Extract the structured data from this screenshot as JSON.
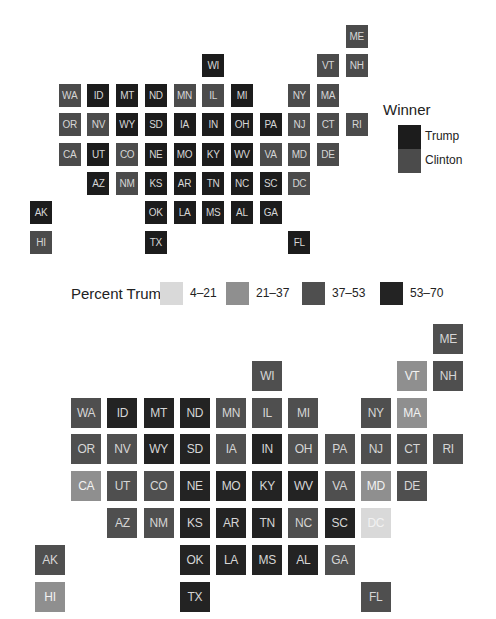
{
  "chart_data": [
    {
      "type": "heatmap",
      "subtype": "tile-grid-map",
      "title": "",
      "legend": {
        "title": "Winner",
        "position": "right",
        "entries": [
          {
            "label": "Trump",
            "color": "#1c1c1c"
          },
          {
            "label": "Clinton",
            "color": "#4b4b4b"
          }
        ]
      },
      "grid": false,
      "tiles": [
        {
          "state": "ME",
          "row": 0,
          "col": 11,
          "value": "Clinton"
        },
        {
          "state": "WI",
          "row": 1,
          "col": 6,
          "value": "Trump"
        },
        {
          "state": "VT",
          "row": 1,
          "col": 10,
          "value": "Clinton"
        },
        {
          "state": "NH",
          "row": 1,
          "col": 11,
          "value": "Clinton"
        },
        {
          "state": "WA",
          "row": 2,
          "col": 1,
          "value": "Clinton"
        },
        {
          "state": "ID",
          "row": 2,
          "col": 2,
          "value": "Trump"
        },
        {
          "state": "MT",
          "row": 2,
          "col": 3,
          "value": "Trump"
        },
        {
          "state": "ND",
          "row": 2,
          "col": 4,
          "value": "Trump"
        },
        {
          "state": "MN",
          "row": 2,
          "col": 5,
          "value": "Clinton"
        },
        {
          "state": "IL",
          "row": 2,
          "col": 6,
          "value": "Clinton"
        },
        {
          "state": "MI",
          "row": 2,
          "col": 7,
          "value": "Trump"
        },
        {
          "state": "NY",
          "row": 2,
          "col": 9,
          "value": "Clinton"
        },
        {
          "state": "MA",
          "row": 2,
          "col": 10,
          "value": "Clinton"
        },
        {
          "state": "OR",
          "row": 3,
          "col": 1,
          "value": "Clinton"
        },
        {
          "state": "NV",
          "row": 3,
          "col": 2,
          "value": "Clinton"
        },
        {
          "state": "WY",
          "row": 3,
          "col": 3,
          "value": "Trump"
        },
        {
          "state": "SD",
          "row": 3,
          "col": 4,
          "value": "Trump"
        },
        {
          "state": "IA",
          "row": 3,
          "col": 5,
          "value": "Trump"
        },
        {
          "state": "IN",
          "row": 3,
          "col": 6,
          "value": "Trump"
        },
        {
          "state": "OH",
          "row": 3,
          "col": 7,
          "value": "Trump"
        },
        {
          "state": "PA",
          "row": 3,
          "col": 8,
          "value": "Trump"
        },
        {
          "state": "NJ",
          "row": 3,
          "col": 9,
          "value": "Clinton"
        },
        {
          "state": "CT",
          "row": 3,
          "col": 10,
          "value": "Clinton"
        },
        {
          "state": "RI",
          "row": 3,
          "col": 11,
          "value": "Clinton"
        },
        {
          "state": "CA",
          "row": 4,
          "col": 1,
          "value": "Clinton"
        },
        {
          "state": "UT",
          "row": 4,
          "col": 2,
          "value": "Trump"
        },
        {
          "state": "CO",
          "row": 4,
          "col": 3,
          "value": "Clinton"
        },
        {
          "state": "NE",
          "row": 4,
          "col": 4,
          "value": "Trump"
        },
        {
          "state": "MO",
          "row": 4,
          "col": 5,
          "value": "Trump"
        },
        {
          "state": "KY",
          "row": 4,
          "col": 6,
          "value": "Trump"
        },
        {
          "state": "WV",
          "row": 4,
          "col": 7,
          "value": "Trump"
        },
        {
          "state": "VA",
          "row": 4,
          "col": 8,
          "value": "Clinton"
        },
        {
          "state": "MD",
          "row": 4,
          "col": 9,
          "value": "Clinton"
        },
        {
          "state": "DE",
          "row": 4,
          "col": 10,
          "value": "Clinton"
        },
        {
          "state": "AZ",
          "row": 5,
          "col": 2,
          "value": "Trump"
        },
        {
          "state": "NM",
          "row": 5,
          "col": 3,
          "value": "Clinton"
        },
        {
          "state": "KS",
          "row": 5,
          "col": 4,
          "value": "Trump"
        },
        {
          "state": "AR",
          "row": 5,
          "col": 5,
          "value": "Trump"
        },
        {
          "state": "TN",
          "row": 5,
          "col": 6,
          "value": "Trump"
        },
        {
          "state": "NC",
          "row": 5,
          "col": 7,
          "value": "Trump"
        },
        {
          "state": "SC",
          "row": 5,
          "col": 8,
          "value": "Trump"
        },
        {
          "state": "DC",
          "row": 5,
          "col": 9,
          "value": "Clinton"
        },
        {
          "state": "AK",
          "row": 6,
          "col": 0,
          "value": "Trump"
        },
        {
          "state": "OK",
          "row": 6,
          "col": 4,
          "value": "Trump"
        },
        {
          "state": "LA",
          "row": 6,
          "col": 5,
          "value": "Trump"
        },
        {
          "state": "MS",
          "row": 6,
          "col": 6,
          "value": "Trump"
        },
        {
          "state": "AL",
          "row": 6,
          "col": 7,
          "value": "Trump"
        },
        {
          "state": "GA",
          "row": 6,
          "col": 8,
          "value": "Trump"
        },
        {
          "state": "HI",
          "row": 7,
          "col": 0,
          "value": "Clinton"
        },
        {
          "state": "TX",
          "row": 7,
          "col": 4,
          "value": "Trump"
        },
        {
          "state": "FL",
          "row": 7,
          "col": 9,
          "value": "Trump"
        }
      ]
    },
    {
      "type": "heatmap",
      "subtype": "tile-grid-map",
      "title": "",
      "legend": {
        "title": "Percent Trump",
        "position": "top",
        "entries": [
          {
            "label": "4–21",
            "color": "#d9d9d9"
          },
          {
            "label": "21–37",
            "color": "#8f8f8f"
          },
          {
            "label": "37–53",
            "color": "#4f4f4f"
          },
          {
            "label": "53–70",
            "color": "#232323"
          }
        ]
      },
      "grid": false,
      "tiles": [
        {
          "state": "ME",
          "row": 0,
          "col": 11,
          "value": "37–53"
        },
        {
          "state": "WI",
          "row": 1,
          "col": 6,
          "value": "37–53"
        },
        {
          "state": "VT",
          "row": 1,
          "col": 10,
          "value": "21–37"
        },
        {
          "state": "NH",
          "row": 1,
          "col": 11,
          "value": "37–53"
        },
        {
          "state": "WA",
          "row": 2,
          "col": 1,
          "value": "37–53"
        },
        {
          "state": "ID",
          "row": 2,
          "col": 2,
          "value": "53–70"
        },
        {
          "state": "MT",
          "row": 2,
          "col": 3,
          "value": "53–70"
        },
        {
          "state": "ND",
          "row": 2,
          "col": 4,
          "value": "53–70"
        },
        {
          "state": "MN",
          "row": 2,
          "col": 5,
          "value": "37–53"
        },
        {
          "state": "IL",
          "row": 2,
          "col": 6,
          "value": "37–53"
        },
        {
          "state": "MI",
          "row": 2,
          "col": 7,
          "value": "37–53"
        },
        {
          "state": "NY",
          "row": 2,
          "col": 9,
          "value": "37–53"
        },
        {
          "state": "MA",
          "row": 2,
          "col": 10,
          "value": "21–37"
        },
        {
          "state": "OR",
          "row": 3,
          "col": 1,
          "value": "37–53"
        },
        {
          "state": "NV",
          "row": 3,
          "col": 2,
          "value": "37–53"
        },
        {
          "state": "WY",
          "row": 3,
          "col": 3,
          "value": "53–70"
        },
        {
          "state": "SD",
          "row": 3,
          "col": 4,
          "value": "53–70"
        },
        {
          "state": "IA",
          "row": 3,
          "col": 5,
          "value": "37–53"
        },
        {
          "state": "IN",
          "row": 3,
          "col": 6,
          "value": "53–70"
        },
        {
          "state": "OH",
          "row": 3,
          "col": 7,
          "value": "37–53"
        },
        {
          "state": "PA",
          "row": 3,
          "col": 8,
          "value": "37–53"
        },
        {
          "state": "NJ",
          "row": 3,
          "col": 9,
          "value": "37–53"
        },
        {
          "state": "CT",
          "row": 3,
          "col": 10,
          "value": "37–53"
        },
        {
          "state": "RI",
          "row": 3,
          "col": 11,
          "value": "37–53"
        },
        {
          "state": "CA",
          "row": 4,
          "col": 1,
          "value": "21–37"
        },
        {
          "state": "UT",
          "row": 4,
          "col": 2,
          "value": "37–53"
        },
        {
          "state": "CO",
          "row": 4,
          "col": 3,
          "value": "37–53"
        },
        {
          "state": "NE",
          "row": 4,
          "col": 4,
          "value": "53–70"
        },
        {
          "state": "MO",
          "row": 4,
          "col": 5,
          "value": "53–70"
        },
        {
          "state": "KY",
          "row": 4,
          "col": 6,
          "value": "53–70"
        },
        {
          "state": "WV",
          "row": 4,
          "col": 7,
          "value": "53–70"
        },
        {
          "state": "VA",
          "row": 4,
          "col": 8,
          "value": "37–53"
        },
        {
          "state": "MD",
          "row": 4,
          "col": 9,
          "value": "21–37"
        },
        {
          "state": "DE",
          "row": 4,
          "col": 10,
          "value": "37–53"
        },
        {
          "state": "AZ",
          "row": 5,
          "col": 2,
          "value": "37–53"
        },
        {
          "state": "NM",
          "row": 5,
          "col": 3,
          "value": "37–53"
        },
        {
          "state": "KS",
          "row": 5,
          "col": 4,
          "value": "53–70"
        },
        {
          "state": "AR",
          "row": 5,
          "col": 5,
          "value": "53–70"
        },
        {
          "state": "TN",
          "row": 5,
          "col": 6,
          "value": "53–70"
        },
        {
          "state": "NC",
          "row": 5,
          "col": 7,
          "value": "37–53"
        },
        {
          "state": "SC",
          "row": 5,
          "col": 8,
          "value": "53–70"
        },
        {
          "state": "DC",
          "row": 5,
          "col": 9,
          "value": "4–21"
        },
        {
          "state": "AK",
          "row": 6,
          "col": 0,
          "value": "37–53"
        },
        {
          "state": "OK",
          "row": 6,
          "col": 4,
          "value": "53–70"
        },
        {
          "state": "LA",
          "row": 6,
          "col": 5,
          "value": "53–70"
        },
        {
          "state": "MS",
          "row": 6,
          "col": 6,
          "value": "53–70"
        },
        {
          "state": "AL",
          "row": 6,
          "col": 7,
          "value": "53–70"
        },
        {
          "state": "GA",
          "row": 6,
          "col": 8,
          "value": "37–53"
        },
        {
          "state": "HI",
          "row": 7,
          "col": 0,
          "value": "21–37"
        },
        {
          "state": "TX",
          "row": 7,
          "col": 4,
          "value": "53–70"
        },
        {
          "state": "FL",
          "row": 7,
          "col": 9,
          "value": "37–53"
        }
      ]
    }
  ],
  "winner_legend": {
    "title": "Winner",
    "trump_label": "Trump",
    "clinton_label": "Clinton"
  },
  "percent_legend": {
    "title": "Percent Trump",
    "bins": [
      "4–21",
      "21–37",
      "37–53",
      "53–70"
    ]
  }
}
